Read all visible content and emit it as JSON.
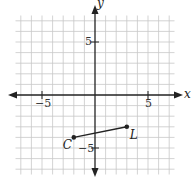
{
  "chart_data": {
    "type": "scatter",
    "title": "",
    "xlabel": "x",
    "ylabel": "y",
    "xlim": [
      -7.5,
      7.5
    ],
    "ylim": [
      -7.5,
      7.5
    ],
    "grid": true,
    "x_ticks_labeled": [
      -5,
      5
    ],
    "y_ticks_labeled": [
      5,
      -5
    ],
    "tick_labels": {
      "x_neg": "−5",
      "x_pos": "5",
      "y_pos": "5",
      "y_neg": "−5"
    },
    "points": [
      {
        "label": "C",
        "x": -2,
        "y": -4
      },
      {
        "label": "L",
        "x": 3,
        "y": -3
      }
    ],
    "segments": [
      {
        "from": "C",
        "to": "L"
      }
    ]
  }
}
